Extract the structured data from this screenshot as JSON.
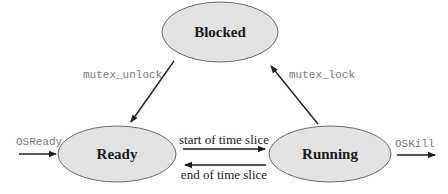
{
  "diagram": {
    "type": "state-machine",
    "states": [
      {
        "id": "blocked",
        "label": "Blocked"
      },
      {
        "id": "ready",
        "label": "Ready"
      },
      {
        "id": "running",
        "label": "Running"
      }
    ],
    "transitions": [
      {
        "from": "blocked",
        "to": "ready",
        "label": "mutex_unlock"
      },
      {
        "from": "running",
        "to": "blocked",
        "label": "mutex_lock"
      },
      {
        "from": "ready",
        "to": "running",
        "label": "start of time slice"
      },
      {
        "from": "running",
        "to": "ready",
        "label": "end of time slice"
      },
      {
        "from": "external",
        "to": "ready",
        "label": "OSReady"
      },
      {
        "from": "running",
        "to": "external",
        "label": "OSKill"
      }
    ],
    "colors": {
      "state_fill": "#e3e3e3",
      "state_stroke": "#6a6a6a",
      "edge": "#1f1f1f",
      "mono_text": "#7a7a7a",
      "text": "#1a1a1a"
    }
  }
}
